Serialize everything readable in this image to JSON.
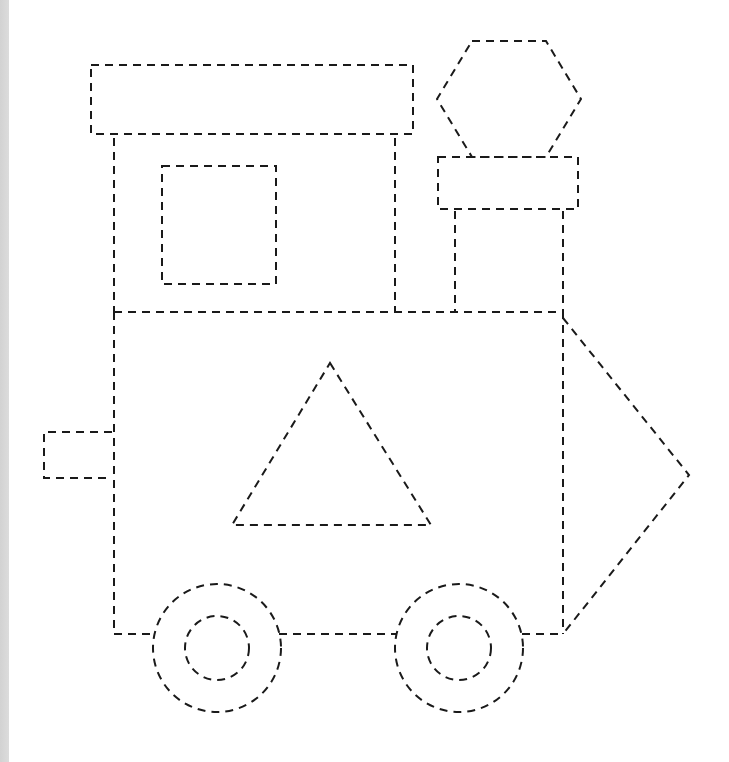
{
  "worksheet": {
    "subject": "train tracing worksheet",
    "line_style": "dashed",
    "stroke_color": "#1a1a1a",
    "background_color": "#ffffff",
    "edge_strip_color": "#d8d8d8",
    "shapes": [
      {
        "name": "roof",
        "type": "rectangle"
      },
      {
        "name": "cab",
        "type": "rectangle"
      },
      {
        "name": "cab-window",
        "type": "square"
      },
      {
        "name": "smokestack-top",
        "type": "hexagon"
      },
      {
        "name": "smokestack-cap",
        "type": "rectangle"
      },
      {
        "name": "smokestack",
        "type": "rectangle"
      },
      {
        "name": "boiler-body",
        "type": "rectangle"
      },
      {
        "name": "body-triangle",
        "type": "triangle"
      },
      {
        "name": "rear-bumper",
        "type": "rectangle"
      },
      {
        "name": "cowcatcher",
        "type": "triangle"
      },
      {
        "name": "rear-wheel",
        "type": "circle"
      },
      {
        "name": "rear-wheel-hub",
        "type": "circle"
      },
      {
        "name": "front-wheel",
        "type": "circle"
      },
      {
        "name": "front-wheel-hub",
        "type": "circle"
      }
    ]
  }
}
